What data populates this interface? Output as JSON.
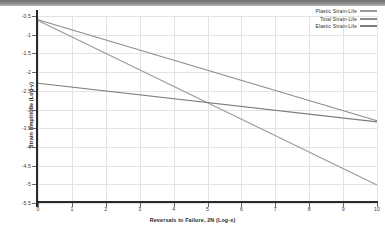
{
  "chart_data": {
    "type": "line",
    "title": "",
    "xlabel": "Reversals to Failure, 2N  (Log-x)",
    "ylabel": "Strain Amplitude  (Log-y)",
    "xlim": [
      0,
      10
    ],
    "ylim": [
      -5.5,
      -0.5
    ],
    "xticks": [
      "0",
      "1",
      "2",
      "3",
      "4",
      "5",
      "6",
      "7",
      "8",
      "9",
      "10"
    ],
    "yticks": [
      "-0.5",
      "-1",
      "-1.5",
      "-2",
      "-2.5",
      "-3",
      "-3.5",
      "-4",
      "-4.5",
      "-5",
      "-5.5"
    ],
    "grid": true,
    "legend_position": "top-right",
    "series": [
      {
        "name": "Plastic Strain-Life",
        "color": "#9a9a9a",
        "x": [
          0,
          10
        ],
        "y": [
          -0.62,
          -5.02
        ]
      },
      {
        "name": "Total Strain-Life",
        "color": "#8c8c8c",
        "x": [
          0,
          10
        ],
        "y": [
          -0.6,
          -3.3
        ]
      },
      {
        "name": "Elastic Strain-Life",
        "color": "#7d7d7d",
        "x": [
          0,
          10
        ],
        "y": [
          -2.3,
          -3.33
        ]
      }
    ]
  },
  "legend": {
    "items": [
      {
        "label": "Plastic Strain-Life"
      },
      {
        "label": "Total Strain-Life"
      },
      {
        "label": "Elastic Strain-Life"
      }
    ]
  }
}
